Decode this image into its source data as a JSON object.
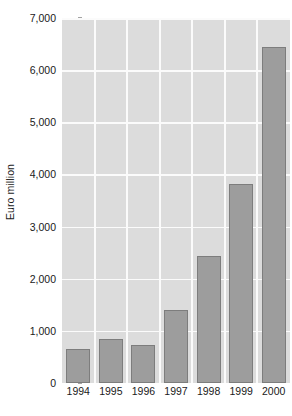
{
  "chart_data": {
    "type": "bar",
    "title": "",
    "subtitle": "",
    "xlabel": "",
    "ylabel": "Euro million",
    "categories": [
      "1994",
      "1995",
      "1996",
      "1997",
      "1998",
      "1999",
      "2000"
    ],
    "values": [
      650,
      840,
      720,
      1400,
      2440,
      3820,
      6450
    ],
    "series": [
      {
        "name": "Euro million",
        "values": [
          650,
          840,
          720,
          1400,
          2440,
          3820,
          6450
        ]
      }
    ],
    "ylim": [
      0,
      7000
    ],
    "ytick_values": [
      0,
      1000,
      2000,
      3000,
      4000,
      5000,
      6000,
      7000
    ],
    "ytick_labels": [
      "0",
      "1,000",
      "2,000",
      "3,000",
      "4,000",
      "5,000",
      "6,000",
      "7,000"
    ],
    "grid": true,
    "grid_orientation": "both",
    "legend": false,
    "legend_position": "none",
    "annotations": [],
    "colors": {
      "bar_fill": "#9d9d9d",
      "bar_border": "#7d7d7d",
      "plot_background": "#dcdcdc",
      "gridline": "#fbfbfb",
      "text": "#1a1a1a",
      "page_background": "#ffffff"
    }
  }
}
